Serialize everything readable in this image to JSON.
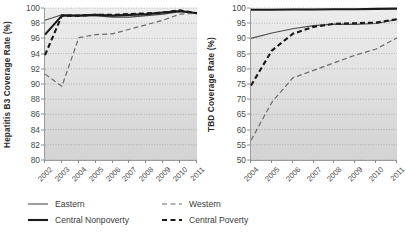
{
  "figure": {
    "title": "",
    "panel_count": 2
  },
  "legend": {
    "position": "bottom-left",
    "entries": [
      {
        "label": "Eastern",
        "style": "thin-solid",
        "color": "#4d4d4d",
        "width": 1.1,
        "dash": "none"
      },
      {
        "label": "Western",
        "style": "thin-dashed",
        "color": "#6b6b6b",
        "width": 1.2,
        "dash": "5,3"
      },
      {
        "label": "Central Nonpoverty",
        "style": "thick-solid",
        "color": "#1a1a1a",
        "width": 2.1,
        "dash": "none"
      },
      {
        "label": "Central Poverty",
        "style": "thick-dashed",
        "color": "#1a1a1a",
        "width": 2.1,
        "dash": "5,3"
      }
    ]
  },
  "chart_data": [
    {
      "id": "hepatitis-b3",
      "type": "line",
      "title": "",
      "xlabel": "",
      "ylabel": "Hepatitis B3 Coverage Rate (%)",
      "x": [
        2002,
        2003,
        2004,
        2005,
        2006,
        2007,
        2008,
        2009,
        2010,
        2011
      ],
      "xtick_labels": [
        "2002",
        "2003",
        "2004",
        "2005",
        "2006",
        "2007",
        "2008",
        "2009",
        "2010",
        "2011"
      ],
      "xlim": [
        2002,
        2011
      ],
      "ylim": [
        80,
        100
      ],
      "ytick_labels": [
        "80",
        "82",
        "84",
        "86",
        "88",
        "90",
        "92",
        "94",
        "96",
        "98",
        "100"
      ],
      "yticks": [
        80,
        82,
        84,
        86,
        88,
        90,
        92,
        94,
        96,
        98,
        100
      ],
      "grid": "horizontal-dotted",
      "series": [
        {
          "name": "Eastern",
          "values": [
            98.4,
            99.1,
            99.0,
            99.0,
            98.8,
            98.8,
            99.0,
            99.2,
            99.5,
            99.3
          ]
        },
        {
          "name": "Central Nonpoverty",
          "values": [
            96.5,
            99.0,
            99.0,
            99.1,
            99.0,
            99.1,
            99.2,
            99.4,
            99.6,
            99.3
          ]
        },
        {
          "name": "Western",
          "values": [
            91.3,
            89.7,
            96.1,
            96.5,
            96.6,
            97.2,
            97.8,
            98.4,
            99.2,
            99.3
          ]
        },
        {
          "name": "Central Poverty",
          "values": [
            93.8,
            99.0,
            99.0,
            99.1,
            99.1,
            99.2,
            99.3,
            99.4,
            99.7,
            99.3
          ]
        }
      ]
    },
    {
      "id": "tbd",
      "type": "line",
      "title": "",
      "xlabel": "",
      "ylabel": "TBD Coverage Rate (%)",
      "x": [
        2004,
        2005,
        2006,
        2007,
        2008,
        2009,
        2010,
        2011
      ],
      "xtick_labels": [
        "2004",
        "2005",
        "2006",
        "2007",
        "2008",
        "2009",
        "2010",
        "2011"
      ],
      "xlim": [
        2004,
        2011
      ],
      "ylim": [
        50,
        100
      ],
      "ytick_labels": [
        "50",
        "55",
        "60",
        "65",
        "70",
        "75",
        "80",
        "85",
        "90",
        "95",
        "100"
      ],
      "yticks": [
        50,
        55,
        60,
        65,
        70,
        75,
        80,
        85,
        90,
        95,
        100
      ],
      "grid": "horizontal-dotted",
      "series": [
        {
          "name": "Eastern",
          "values": [
            90.0,
            91.8,
            93.2,
            94.2,
            94.7,
            94.6,
            94.9,
            96.2
          ]
        },
        {
          "name": "Central Nonpoverty",
          "values": [
            99.4,
            99.4,
            99.5,
            99.5,
            99.6,
            99.6,
            99.7,
            99.8
          ]
        },
        {
          "name": "Western",
          "values": [
            56.5,
            69.0,
            77.0,
            79.5,
            82.0,
            84.5,
            86.5,
            90.2
          ]
        },
        {
          "name": "Central Poverty",
          "values": [
            74.5,
            86.0,
            91.5,
            93.8,
            94.8,
            95.0,
            95.2,
            96.3
          ]
        }
      ]
    }
  ]
}
